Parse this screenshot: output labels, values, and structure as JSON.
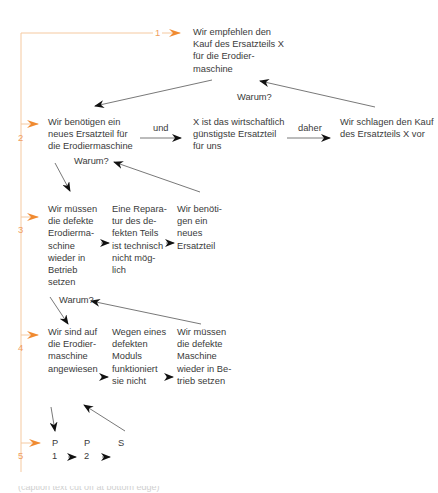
{
  "diagram": {
    "type": "argument-pyramid",
    "accent_color": "#f08a30",
    "text_color": "#3a3a3a",
    "levels": [
      {
        "number": "1",
        "nodes": [
          {
            "text": "Wir empfehlen den\nKauf des Ersatzteils X\nfür die Erodier-\nmaschine"
          }
        ]
      },
      {
        "number": "2",
        "question": "Warum?",
        "nodes": [
          {
            "text": "Wir benötigen ein\nneues Ersatzteil für\ndie Erodiermaschine"
          },
          {
            "text": "X ist das wirtschaftlich\ngünstigste Ersatzteil\nfür uns"
          },
          {
            "text": "Wir schlagen den Kauf\ndes Ersatzteils X vor"
          }
        ],
        "connectors": [
          "und",
          "daher"
        ]
      },
      {
        "number": "3",
        "question": "Warum?",
        "nodes": [
          {
            "text": "Wir müssen\ndie defekte\nErodierma-\nschine\nwieder in\nBetrieb\nsetzen"
          },
          {
            "text": "Eine Repara-\ntur des de-\nfekten Teils\nist technisch\nnicht mög-\nlich"
          },
          {
            "text": "Wir benöti-\ngen ein\nneues\nErsatzteil"
          }
        ]
      },
      {
        "number": "4",
        "question": "Warum?",
        "nodes": [
          {
            "text": "Wir sind auf\ndie Erodier-\nmaschine\nangewiesen"
          },
          {
            "text": "Wegen eines\ndefekten\nModuls\nfunktioniert\nsie nicht"
          },
          {
            "text": "Wir müssen\ndie defekte\nMaschine\nwieder in Be-\ntrieb setzen"
          }
        ]
      },
      {
        "number": "5",
        "nodes": [
          {
            "text": "P\n1"
          },
          {
            "text": "P\n2"
          },
          {
            "text": "S"
          }
        ]
      }
    ],
    "footer_text": "(caption text cut off at bottom edge)"
  }
}
